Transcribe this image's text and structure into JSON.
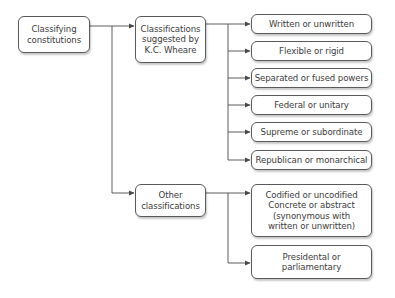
{
  "diagram": {
    "root": {
      "label": "Classifying\nconstitutions"
    },
    "branches": [
      {
        "label": "Classifications\nsuggested by\nK.C. Wheare",
        "children": [
          {
            "label": "Written or unwritten"
          },
          {
            "label": "Flexible or rigid"
          },
          {
            "label": "Separated or fused powers"
          },
          {
            "label": "Federal or unitary"
          },
          {
            "label": "Supreme or subordinate"
          },
          {
            "label": "Republican or monarchical"
          }
        ]
      },
      {
        "label": "Other\nclassifications",
        "children": [
          {
            "label": "Codified or uncodified\nConcrete or abstract\n(synonymous with\nwritten or unwritten)"
          },
          {
            "label": "Presidental or\nparliamentary"
          }
        ]
      }
    ],
    "colors": {
      "line": "#4a4a4a",
      "box_border": "#5a5a5a",
      "text": "#3c3c3c"
    }
  }
}
